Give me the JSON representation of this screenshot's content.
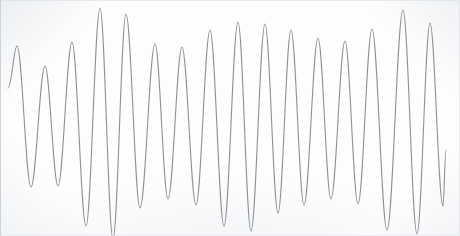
{
  "chart_data": {
    "type": "line",
    "title": "",
    "subtitle": "",
    "xlabel": "",
    "ylabel": "",
    "xlim": [
      0,
      460
    ],
    "ylim": [
      0,
      236
    ],
    "grid": false,
    "legend": null,
    "axes_visible": false,
    "tick_labels_x": [],
    "tick_labels_y": [],
    "annotations": [],
    "series": [
      {
        "name": "oscillogram-trace",
        "color": "#8d9096",
        "line_width": 1.1,
        "start_point": {
          "x": 8,
          "y": 88
        },
        "end_point": {
          "x": 446,
          "y": 150
        },
        "peaks": [
          {
            "x": 17,
            "y": 46
          },
          {
            "x": 45,
            "y": 66
          },
          {
            "x": 72,
            "y": 42
          },
          {
            "x": 100,
            "y": 8
          },
          {
            "x": 126,
            "y": 14
          },
          {
            "x": 155,
            "y": 44
          },
          {
            "x": 182,
            "y": 47
          },
          {
            "x": 210,
            "y": 30
          },
          {
            "x": 238,
            "y": 22
          },
          {
            "x": 265,
            "y": 24
          },
          {
            "x": 291,
            "y": 30
          },
          {
            "x": 318,
            "y": 38
          },
          {
            "x": 345,
            "y": 41
          },
          {
            "x": 372,
            "y": 29
          },
          {
            "x": 403,
            "y": 10
          },
          {
            "x": 430,
            "y": 23
          }
        ],
        "troughs": [
          {
            "x": 31,
            "y": 187
          },
          {
            "x": 58,
            "y": 186
          },
          {
            "x": 86,
            "y": 226
          },
          {
            "x": 113,
            "y": 239
          },
          {
            "x": 140,
            "y": 208
          },
          {
            "x": 168,
            "y": 199
          },
          {
            "x": 196,
            "y": 205
          },
          {
            "x": 224,
            "y": 226
          },
          {
            "x": 251,
            "y": 231
          },
          {
            "x": 278,
            "y": 213
          },
          {
            "x": 304,
            "y": 205
          },
          {
            "x": 331,
            "y": 199
          },
          {
            "x": 358,
            "y": 204
          },
          {
            "x": 387,
            "y": 230
          },
          {
            "x": 417,
            "y": 234
          },
          {
            "x": 443,
            "y": 206
          }
        ],
        "cycle_count": 17
      }
    ]
  },
  "figure": {
    "background_color": "#fdfdfd",
    "border_color": "#c4c9d0",
    "trace_color": "#8d9096",
    "width_px": 460,
    "height_px": 236
  }
}
